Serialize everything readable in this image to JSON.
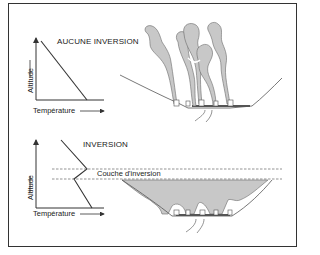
{
  "panels": [
    {
      "title": "AUCUNE INVERSION",
      "x_label": "Température",
      "y_label": "Altitude"
    },
    {
      "title": "INVERSION",
      "x_label": "Température",
      "y_label": "Altitude",
      "layer_label": "Couche d'inversion"
    }
  ],
  "colors": {
    "line": "#333333",
    "smoke_fill": "#c8c8c8",
    "smoke_stroke": "#6a6a6a",
    "dashed": "#666666"
  }
}
